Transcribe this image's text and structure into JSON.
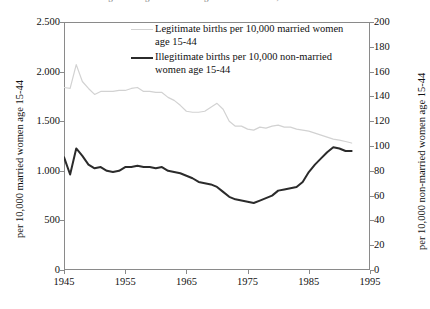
{
  "figure": {
    "title_fragment": "Figure 1. Legitimate and Illegitimate Birth Rates, United States"
  },
  "legend": {
    "position": "top-center-inside",
    "items": [
      {
        "key": "legitimate",
        "swatch": "thin-light-gray-line",
        "label": "Legitimate births per 10,000 married women age 15-44",
        "color": "#d2d2d2"
      },
      {
        "key": "illegitimate",
        "swatch": "thick-dark-line",
        "label": "Illegitimate births per 10,000 non-married women age 15-44",
        "color": "#2b2b2b"
      }
    ]
  },
  "axes": {
    "x": {
      "label": "",
      "ticks": [
        "1945",
        "1955",
        "1965",
        "1975",
        "1985",
        "1995"
      ],
      "min": 1945,
      "max": 1995
    },
    "y_left": {
      "label": "per 10,000 married women age 15-44",
      "ticks": [
        "0",
        "500",
        "1.000",
        "1.500",
        "2.000",
        "2.500"
      ],
      "min": 0,
      "max": 2500
    },
    "y_right": {
      "label": "per 10,000 non-married women age 15-44",
      "ticks": [
        "0",
        "20",
        "40",
        "60",
        "80",
        "100",
        "120",
        "140",
        "160",
        "180",
        "200"
      ],
      "min": 0,
      "max": 200
    }
  },
  "chart_data": {
    "type": "line",
    "title": "Legitimate and Illegitimate Birth Rates",
    "xlabel": "",
    "ylabel": "per 10,000 married women age 15-44",
    "ylabel_secondary": "per 10,000 non-married women age 15-44",
    "xlim": [
      1945,
      1995
    ],
    "ylim": [
      0,
      2500
    ],
    "ylim_secondary": [
      0,
      200
    ],
    "grid": false,
    "legend_position": "top-center-inside",
    "x": [
      1945,
      1946,
      1947,
      1948,
      1949,
      1950,
      1951,
      1952,
      1953,
      1954,
      1955,
      1956,
      1957,
      1958,
      1959,
      1960,
      1961,
      1962,
      1963,
      1964,
      1965,
      1966,
      1967,
      1968,
      1969,
      1970,
      1971,
      1972,
      1973,
      1974,
      1975,
      1976,
      1977,
      1978,
      1979,
      1980,
      1981,
      1982,
      1983,
      1984,
      1985,
      1986,
      1987,
      1988,
      1989,
      1990,
      1991,
      1992
    ],
    "series": [
      {
        "name": "Legitimate births per 10,000 married women age 15-44",
        "axis": "left",
        "color": "#d2d2d2",
        "width": 1.2,
        "values": [
          1840,
          1830,
          2070,
          1900,
          1830,
          1770,
          1800,
          1800,
          1800,
          1810,
          1810,
          1830,
          1840,
          1800,
          1800,
          1790,
          1790,
          1740,
          1710,
          1660,
          1600,
          1590,
          1590,
          1600,
          1640,
          1680,
          1620,
          1500,
          1450,
          1450,
          1420,
          1410,
          1440,
          1430,
          1450,
          1460,
          1440,
          1440,
          1420,
          1410,
          1400,
          1380,
          1360,
          1340,
          1320,
          1310,
          1295,
          1280
        ]
      },
      {
        "name": "Illegitimate births per 10,000 non-married women age 15-44",
        "axis": "right",
        "color": "#2b2b2b",
        "width": 2.2,
        "values": [
          91,
          77,
          98,
          92,
          85,
          82,
          83,
          80,
          79,
          80,
          83,
          83,
          84,
          83,
          83,
          82,
          83,
          80,
          79,
          78,
          76,
          74,
          71,
          70,
          69,
          67,
          63,
          59,
          57,
          56,
          55,
          54,
          56,
          58,
          60,
          64,
          65,
          66,
          67,
          71,
          79,
          85,
          90,
          95,
          99,
          98,
          96,
          96
        ]
      }
    ]
  }
}
